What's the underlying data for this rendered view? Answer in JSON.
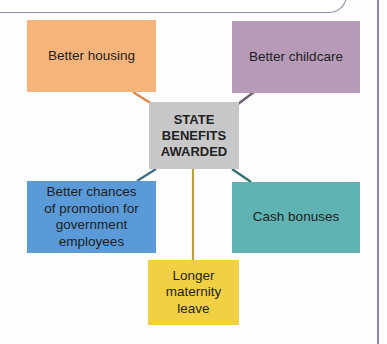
{
  "diagram": {
    "center": {
      "line1": "STATE",
      "line2": "BENEFITS",
      "line3": "AWARDED",
      "color": "#c8c8c8"
    },
    "nodes": [
      {
        "id": "housing",
        "label": "Better housing",
        "color": "#f5b57a"
      },
      {
        "id": "childcare",
        "label": "Better childcare",
        "color": "#b79ab8"
      },
      {
        "id": "promotion",
        "lines": [
          "Better chances",
          "of promotion for",
          "government",
          "employees"
        ],
        "color": "#5b9ad8"
      },
      {
        "id": "cash",
        "label": "Cash bonuses",
        "color": "#5fb3b3"
      },
      {
        "id": "maternity",
        "lines": [
          "Longer",
          "maternity",
          "leave"
        ],
        "color": "#f2d043"
      }
    ],
    "connector_colors": {
      "housing": "#e0844a",
      "childcare": "#6a5a6e",
      "promotion": "#3f6a88",
      "cash": "#2f6f6f",
      "maternity": "#b8a43a"
    }
  }
}
